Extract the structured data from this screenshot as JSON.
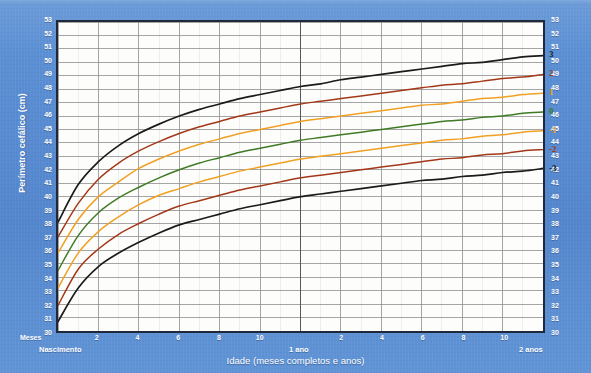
{
  "chart_data": {
    "type": "line",
    "title": "",
    "xlabel": "Idade (meses completos e anos)",
    "ylabel": "Perímetro cefálico (cm)",
    "xlim": [
      0,
      24
    ],
    "ylim": [
      30,
      53
    ],
    "grid": true,
    "legend_position": "right-inline",
    "x_unit": "months",
    "y_unit": "cm",
    "x_major_ticks": [
      0,
      2,
      4,
      6,
      8,
      10,
      12,
      14,
      16,
      18,
      20,
      22,
      24
    ],
    "x_tick_labels": [
      "Nascimento",
      "2",
      "4",
      "6",
      "8",
      "10",
      "1 ano",
      "2",
      "4",
      "6",
      "8",
      "10",
      "2 anos"
    ],
    "x_minor_step": 1,
    "y_ticks": [
      30,
      31,
      32,
      33,
      34,
      35,
      36,
      37,
      38,
      39,
      40,
      41,
      42,
      43,
      44,
      45,
      46,
      47,
      48,
      49,
      50,
      51,
      52,
      53
    ],
    "y_tick_labels": [
      "30",
      "31",
      "32",
      "33",
      "34",
      "35",
      "36",
      "37",
      "38",
      "39",
      "40",
      "41",
      "42",
      "43",
      "44",
      "45",
      "46",
      "47",
      "48",
      "49",
      "50",
      "51",
      "52",
      "53"
    ],
    "x_values": [
      0,
      1,
      2,
      3,
      4,
      5,
      6,
      7,
      8,
      9,
      10,
      11,
      12,
      13,
      14,
      15,
      16,
      17,
      18,
      19,
      20,
      21,
      22,
      23,
      24
    ],
    "series": [
      {
        "name": "3",
        "label": "3",
        "color": "#1b1b1b",
        "values": [
          38.1,
          40.9,
          42.6,
          43.8,
          44.7,
          45.4,
          46.0,
          46.5,
          46.9,
          47.3,
          47.6,
          47.9,
          48.2,
          48.4,
          48.7,
          48.9,
          49.1,
          49.3,
          49.5,
          49.7,
          49.9,
          50.0,
          50.2,
          50.4,
          50.5
        ]
      },
      {
        "name": "2",
        "label": "2",
        "color": "#a33818",
        "values": [
          37.0,
          39.5,
          41.3,
          42.5,
          43.4,
          44.1,
          44.7,
          45.2,
          45.6,
          46.0,
          46.3,
          46.6,
          46.9,
          47.1,
          47.3,
          47.5,
          47.7,
          47.9,
          48.1,
          48.3,
          48.4,
          48.6,
          48.8,
          48.9,
          49.1
        ]
      },
      {
        "name": "1",
        "label": "1",
        "color": "#f0a022",
        "values": [
          35.8,
          38.3,
          40.0,
          41.1,
          42.1,
          42.8,
          43.4,
          43.9,
          44.3,
          44.7,
          45.0,
          45.3,
          45.6,
          45.8,
          46.0,
          46.2,
          46.4,
          46.6,
          46.8,
          46.9,
          47.1,
          47.3,
          47.4,
          47.6,
          47.7
        ]
      },
      {
        "name": "0",
        "label": "0",
        "color": "#3f7a25",
        "values": [
          34.5,
          37.1,
          38.8,
          39.9,
          40.7,
          41.4,
          42.0,
          42.5,
          42.9,
          43.3,
          43.6,
          43.9,
          44.2,
          44.4,
          44.6,
          44.8,
          45.0,
          45.2,
          45.4,
          45.6,
          45.7,
          45.9,
          46.0,
          46.2,
          46.3
        ]
      },
      {
        "name": "-1",
        "label": "-1",
        "color": "#f0a022",
        "values": [
          33.2,
          35.8,
          37.4,
          38.5,
          39.4,
          40.1,
          40.6,
          41.1,
          41.5,
          41.9,
          42.2,
          42.5,
          42.8,
          43.0,
          43.2,
          43.4,
          43.6,
          43.8,
          44.0,
          44.2,
          44.3,
          44.5,
          44.6,
          44.8,
          44.9
        ]
      },
      {
        "name": "-2",
        "label": "-2",
        "color": "#a33818",
        "values": [
          31.9,
          34.6,
          36.1,
          37.2,
          38.0,
          38.7,
          39.3,
          39.7,
          40.1,
          40.5,
          40.8,
          41.1,
          41.4,
          41.6,
          41.8,
          42.0,
          42.2,
          42.4,
          42.6,
          42.8,
          42.9,
          43.1,
          43.2,
          43.4,
          43.5
        ]
      },
      {
        "name": "-3",
        "label": "-3",
        "color": "#1b1b1b",
        "values": [
          30.7,
          33.2,
          34.8,
          35.8,
          36.6,
          37.3,
          37.9,
          38.3,
          38.7,
          39.1,
          39.4,
          39.7,
          40.0,
          40.2,
          40.4,
          40.6,
          40.8,
          41.0,
          41.2,
          41.3,
          41.5,
          41.6,
          41.8,
          41.9,
          42.1
        ]
      }
    ],
    "reference_line_x": 12,
    "reference_line_label": "1 ano"
  },
  "labels": {
    "y_axis_title": "Perímetro cefálico (cm)",
    "x_axis_title": "Idade (meses completos e anos)",
    "meses": "Meses",
    "nascimento": "Nascimento",
    "one_year": "1 ano",
    "two_years": "2 anos"
  },
  "colors": {
    "background": "#5b8fd4",
    "plot_background": "#fdfdfc",
    "frame": "#20293a",
    "gridline_major": "#8d8d8d",
    "gridline_minor": "#dcdcdc",
    "z3": "#1b1b1b",
    "z2": "#a33818",
    "z1": "#f0a022",
    "z0": "#3f7a25"
  }
}
